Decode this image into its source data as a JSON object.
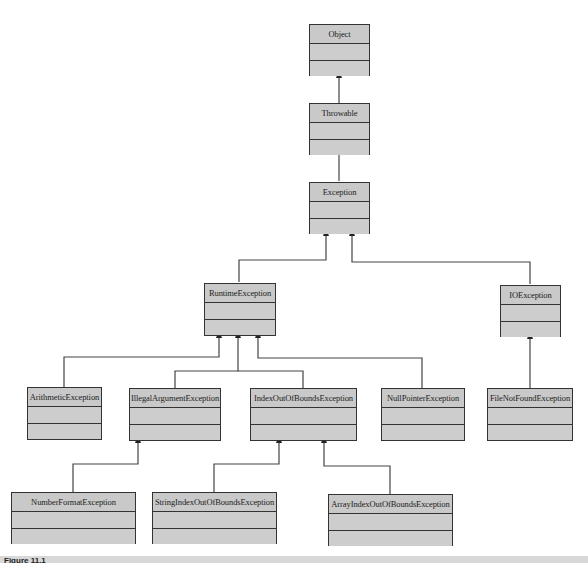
{
  "diagram": {
    "type": "uml-class-hierarchy",
    "caption": "Figure 11.1",
    "colors": {
      "box_fill": "#c9c9c9",
      "border": "#333333",
      "line": "#333333",
      "caption_bar": "#d8d8d8"
    },
    "classes": {
      "object": {
        "name": "Object"
      },
      "throwable": {
        "name": "Throwable"
      },
      "exception": {
        "name": "Exception"
      },
      "runtime_exception": {
        "name": "RuntimeException"
      },
      "io_exception": {
        "name": "IOException"
      },
      "arithmetic_exception": {
        "name": "ArithmeticException"
      },
      "illegal_argument_exception": {
        "name": "IllegalArgumentException"
      },
      "index_out_of_bounds_exception": {
        "name": "IndexOutOfBoundsException"
      },
      "null_pointer_exception": {
        "name": "NullPointerException"
      },
      "file_not_found_exception": {
        "name": "FileNotFoundException"
      },
      "number_format_exception": {
        "name": "NumberFormatException"
      },
      "string_index_out_of_bounds_exception": {
        "name": "StringIndexOutOfBoundsException"
      },
      "array_index_out_of_bounds_exception": {
        "name": "ArrayIndexOutOfBoundsException"
      }
    },
    "inheritance": [
      {
        "child": "Throwable",
        "parent": "Object"
      },
      {
        "child": "Exception",
        "parent": "Throwable"
      },
      {
        "child": "RuntimeException",
        "parent": "Exception"
      },
      {
        "child": "IOException",
        "parent": "Exception"
      },
      {
        "child": "ArithmeticException",
        "parent": "RuntimeException"
      },
      {
        "child": "IllegalArgumentException",
        "parent": "RuntimeException"
      },
      {
        "child": "IndexOutOfBoundsException",
        "parent": "RuntimeException"
      },
      {
        "child": "NullPointerException",
        "parent": "RuntimeException"
      },
      {
        "child": "FileNotFoundException",
        "parent": "IOException"
      },
      {
        "child": "NumberFormatException",
        "parent": "IllegalArgumentException"
      },
      {
        "child": "StringIndexOutOfBoundsException",
        "parent": "IndexOutOfBoundsException"
      },
      {
        "child": "ArrayIndexOutOfBoundsException",
        "parent": "IndexOutOfBoundsException"
      }
    ]
  }
}
